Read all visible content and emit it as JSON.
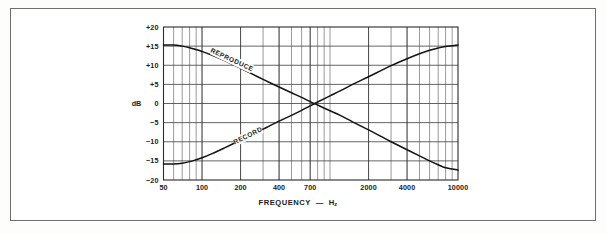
{
  "figure": {
    "frame_color": "#6e6e70",
    "background": "#ffffff",
    "plot_line_color": "#131314",
    "grid_color": "#55565a"
  },
  "chart_data": {
    "type": "line",
    "title": "",
    "subtitle": "",
    "xlabel": "FREQUENCY",
    "xunit": "Hz",
    "xunit_sub": "z",
    "xlabel_dash": "—",
    "ylabel": "dB",
    "xscale": "log",
    "xlim": [
      50,
      10000
    ],
    "ylim": [
      -20,
      20
    ],
    "ytick_step": 5,
    "grid": true,
    "legend": "inline-curve-labels",
    "xticks": [
      50,
      100,
      200,
      400,
      700,
      2000,
      4000,
      10000
    ],
    "xtick_labels": [
      "50",
      "100",
      "200",
      "400",
      "700",
      "2000",
      "4000",
      "10000"
    ],
    "xgrid_minor": [
      60,
      70,
      80,
      90,
      100,
      200,
      300,
      400,
      500,
      600,
      700,
      800,
      900,
      1000,
      2000,
      3000,
      4000,
      5000,
      6000,
      7000,
      8000,
      9000,
      10000
    ],
    "yticks": [
      -20,
      -15,
      -10,
      -5,
      0,
      5,
      10,
      15,
      20
    ],
    "ytick_labels": [
      "−20",
      "−15",
      "−10",
      "−5",
      "0",
      "+5",
      "+10",
      "+15",
      "+20"
    ],
    "series": [
      {
        "name": "REPRODUCE",
        "label": "REPRODUCE",
        "label_x": 170,
        "label_y": 11.2,
        "x": [
          50,
          60,
          70,
          80,
          90,
          100,
          120,
          150,
          200,
          250,
          300,
          400,
          500,
          600,
          700,
          800,
          1000,
          1200,
          1500,
          2000,
          2500,
          3000,
          4000,
          5000,
          6000,
          7000,
          8000,
          10000
        ],
        "values": [
          15.3,
          15.3,
          15.0,
          14.6,
          14.1,
          13.6,
          12.6,
          11.2,
          9.2,
          7.6,
          6.3,
          4.3,
          2.8,
          1.6,
          0.5,
          -0.4,
          -1.9,
          -3.1,
          -4.8,
          -6.9,
          -8.6,
          -10.0,
          -12.1,
          -13.7,
          -15.0,
          -16.0,
          -16.8,
          -17.4
        ]
      },
      {
        "name": "RECORD",
        "label": "RECORD",
        "label_x": 230,
        "label_y": -8.6,
        "x": [
          50,
          60,
          70,
          80,
          90,
          100,
          120,
          150,
          200,
          250,
          300,
          400,
          500,
          600,
          700,
          800,
          1000,
          1200,
          1500,
          2000,
          2500,
          3000,
          4000,
          5000,
          6000,
          7000,
          8000,
          10000
        ],
        "values": [
          -15.8,
          -15.8,
          -15.6,
          -15.2,
          -14.7,
          -14.2,
          -13.1,
          -11.6,
          -9.6,
          -8.0,
          -6.7,
          -4.6,
          -3.1,
          -1.8,
          -0.6,
          0.4,
          2.0,
          3.3,
          5.0,
          7.0,
          8.6,
          9.9,
          11.7,
          13.0,
          13.9,
          14.5,
          14.9,
          15.3
        ]
      }
    ],
    "crossover": {
      "frequency": 700,
      "db": 0
    }
  }
}
